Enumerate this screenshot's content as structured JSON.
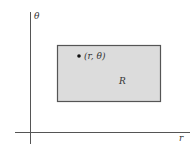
{
  "diagram": {
    "axes": {
      "vertical_label": "θ",
      "horizontal_label": "r"
    },
    "region": {
      "label": "R",
      "fill": "#dcdcdc",
      "stroke": "#555555"
    },
    "point": {
      "label": "(r, θ)"
    }
  }
}
